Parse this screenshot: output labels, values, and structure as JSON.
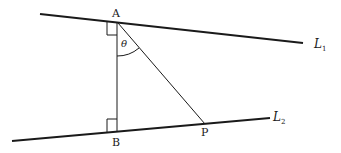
{
  "diagram": {
    "type": "geometry",
    "colors": {
      "stroke": "#1a1a1a",
      "background": "#ffffff"
    },
    "points": {
      "A": {
        "label": "A"
      },
      "B": {
        "label": "B"
      },
      "P": {
        "label": "P"
      }
    },
    "lines": {
      "L1": {
        "label": "L",
        "subscript": "1"
      },
      "L2": {
        "label": "L",
        "subscript": "2"
      }
    },
    "angle": {
      "label": "θ",
      "vertex": "A",
      "between": [
        "AB",
        "AP"
      ]
    },
    "right_angles": [
      "at A between L1 and AB",
      "at B between L2 and AB"
    ]
  }
}
